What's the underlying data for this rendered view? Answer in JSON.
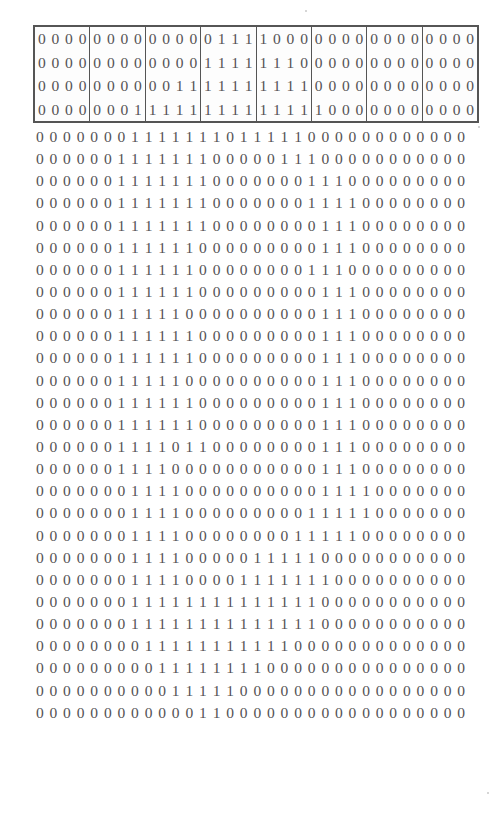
{
  "figure": {
    "columns": 32,
    "rows": 32,
    "group_size": 4,
    "group_count": 8,
    "boxed_row_count": 4,
    "zero_glyph": "0",
    "one_glyph": "1",
    "colors": {
      "background": "#ffffff",
      "digit": "#555355",
      "box_border": "#555555",
      "group_divider": "#555555"
    }
  },
  "chart_data": {
    "type": "heatmap",
    "xlabel": "",
    "ylabel": "",
    "categories": [
      "0",
      "1"
    ],
    "rows": [
      "00000000000001111000000000000000",
      "00000000000011111110000000000000",
      "00000000001111111111000000000000",
      "00000001111111111111100000000000",
      "00000001111111011111000000000000",
      "00000011111110000011100000000000",
      "00000011111110000000111000000000",
      "00000011111110000000111100000000",
      "00000011111110000000011100000000",
      "00000011111100000000011100000000",
      "00000011111100000000111000000000",
      "00000011111100000000011100000000",
      "00000011111000000000011100000000",
      "00000011111100000000011100000000",
      "00000011111100000000011100000000",
      "00000011111000000000011100000000",
      "00000011111100000000011100000000",
      "00000011111100000000011100000000",
      "00000011110110000000011100000000",
      "00000011110000000000011100000000",
      "00000001111000000000011110000000",
      "00000001111000000000111110000000",
      "00000001111000000001111100000000",
      "00000001111000001111100000000000",
      "00000001111000011111110000000000",
      "00000001111111111111100000000000",
      "00000001111111111111100000000000",
      "00000000111111111110000000000000",
      "00000000011111111000000000000000",
      "00000000001111100000000000000000",
      "00000000000011000000000000000000",
      "00000000000000000000000000000000"
    ],
    "boxed_rows": [
      "00000000000001111000000000000000",
      "00000000000011111110000000000000",
      "00000000001111111111000000000000",
      "00000001111111111111100000000000"
    ],
    "boxed_row_groups": [
      [
        "0000",
        "0000",
        "0000",
        "0111",
        "1000",
        "0000",
        "0000",
        "0000"
      ],
      [
        "0000",
        "0000",
        "0000",
        "1111",
        "1110",
        "0000",
        "0000",
        "0000"
      ],
      [
        "0000",
        "0000",
        "0011",
        "1111",
        "1111",
        "0000",
        "0000",
        "0000"
      ],
      [
        "0000",
        "0001",
        "1111",
        "1111",
        "1111",
        "1000",
        "0000",
        "0000"
      ]
    ],
    "plain_rows": [
      "00000001111111011111000000000000",
      "00000011111110000011100000000000",
      "00000011111110000000111000000000",
      "00000011111110000000111100000000",
      "00000011111110000000011100000000",
      "00000011111100000000011100000000",
      "00000011111100000000111000000000",
      "00000011111100000000011100000000",
      "00000011111000000000011100000000",
      "00000011111100000000011100000000",
      "00000011111100000000011100000000",
      "00000011111000000000011100000000",
      "00000011111100000000011100000000",
      "00000011111100000000011100000000",
      "00000011110110000000011100000000",
      "00000011110000000000011100000000",
      "00000001111000000000011110000000",
      "00000001111000000000111110000000",
      "00000001111000000001111100000000",
      "00000001111000001111100000000000",
      "00000001111000011111110000000000",
      "00000001111111111111100000000000",
      "00000001111111111111100000000000",
      "00000000111111111110000000000000",
      "00000000011111111000000000000000",
      "00000000001111100000000000000000",
      "00000000000011000000000000000000"
    ]
  }
}
